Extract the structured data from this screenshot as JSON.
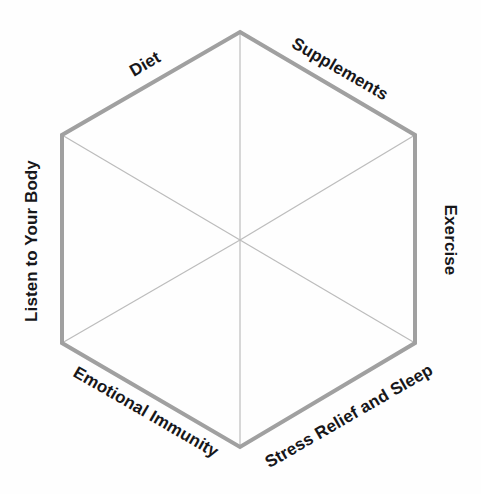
{
  "diagram": {
    "type": "hexagon-wheel",
    "shape": "hexagon",
    "orientation": "pointy-top",
    "segments": 6,
    "background_color": "#fefefe",
    "outline_color": "#a0a0a0",
    "outline_width": 4,
    "spoke_color": "#bcbcbc",
    "spoke_width": 1,
    "label_color": "#17171a",
    "center": {
      "x": 240,
      "y": 240
    },
    "vertices": [
      {
        "name": "top",
        "x": 240,
        "y": 32
      },
      {
        "name": "upper-right",
        "x": 415,
        "y": 135
      },
      {
        "name": "lower-right",
        "x": 415,
        "y": 343
      },
      {
        "name": "bottom",
        "x": 240,
        "y": 447
      },
      {
        "name": "lower-left",
        "x": 62,
        "y": 343
      },
      {
        "name": "upper-left",
        "x": 62,
        "y": 135
      }
    ],
    "labels": [
      {
        "id": "diet",
        "text": "Diet",
        "rotation": -30,
        "edge": "upper-left"
      },
      {
        "id": "supplements",
        "text": "Supplements",
        "rotation": 30,
        "edge": "upper-right"
      },
      {
        "id": "exercise",
        "text": "Exercise",
        "rotation": 90,
        "edge": "right"
      },
      {
        "id": "stress",
        "text": "Stress Relief and Sleep",
        "rotation": -30,
        "edge": "lower-right"
      },
      {
        "id": "emotional",
        "text": "Emotional Immunity",
        "rotation": 30,
        "edge": "lower-left"
      },
      {
        "id": "listen",
        "text": "Listen to Your Body",
        "rotation": -90,
        "edge": "left"
      }
    ]
  }
}
